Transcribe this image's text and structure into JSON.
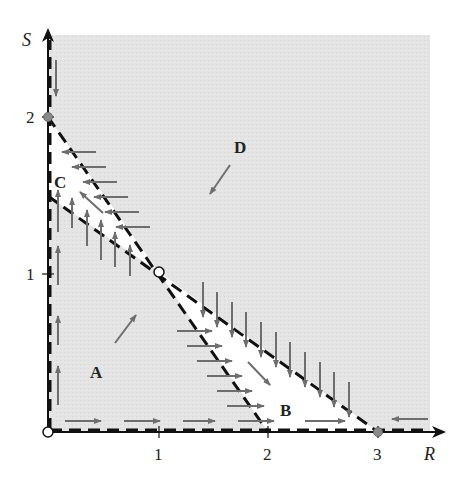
{
  "figure": {
    "axes": {
      "x_label": "R",
      "y_label": "S",
      "x_ticks": [
        {
          "value": 1,
          "label": "1"
        },
        {
          "value": 2,
          "label": "2"
        },
        {
          "value": 3,
          "label": "3"
        }
      ],
      "y_ticks": [
        {
          "value": 1,
          "label": "1"
        },
        {
          "value": 2,
          "label": "2"
        }
      ]
    },
    "regions": [
      {
        "id": "A",
        "label": "A",
        "shade": "gray"
      },
      {
        "id": "B",
        "label": "B",
        "shade": "white"
      },
      {
        "id": "C",
        "label": "C",
        "shade": "white"
      },
      {
        "id": "D",
        "label": "D",
        "shade": "gray"
      }
    ],
    "nullclines": [
      {
        "name": "line-S-2-to-R-2",
        "from": [
          0,
          2
        ],
        "to": [
          2,
          0
        ],
        "style": "dashed"
      },
      {
        "name": "line-S-1.5-to-R-3",
        "from": [
          0,
          1.5
        ],
        "to": [
          3,
          0
        ],
        "style": "dashed"
      },
      {
        "name": "R-axis",
        "from": [
          0,
          0
        ],
        "to": [
          3.6,
          0
        ],
        "style": "dashed"
      },
      {
        "name": "S-axis",
        "from": [
          0,
          0
        ],
        "to": [
          0,
          2.5
        ],
        "style": "dashed"
      }
    ],
    "equilibria": [
      {
        "point": [
          0,
          0
        ],
        "type": "open"
      },
      {
        "point": [
          1,
          1
        ],
        "type": "open"
      },
      {
        "point": [
          0,
          2
        ],
        "type": "filled"
      },
      {
        "point": [
          3,
          0
        ],
        "type": "filled"
      }
    ],
    "colors": {
      "gray_region": "#e6e6e6",
      "white_region": "#ffffff",
      "arrow": "#6e6e6e",
      "lines": "#111111",
      "filled_equilibrium": "#8a8a8a"
    }
  }
}
